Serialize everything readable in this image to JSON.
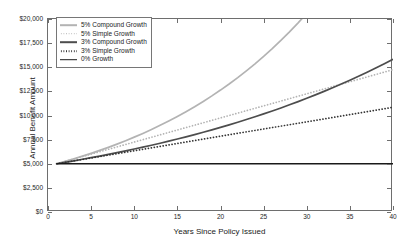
{
  "chart_data": {
    "type": "line",
    "title": "",
    "xlabel": "Years Since Policy Issued",
    "ylabel": "Annual Benefit Amount",
    "xlim": [
      0,
      40
    ],
    "ylim": [
      0,
      20000
    ],
    "xticks": [
      0,
      5,
      10,
      15,
      20,
      25,
      30,
      35,
      40
    ],
    "xtick_labels": [
      "0",
      "5",
      "10",
      "15",
      "20",
      "25",
      "30",
      "35",
      "40"
    ],
    "yticks": [
      0,
      2500,
      5000,
      7500,
      10000,
      12500,
      15000,
      17500,
      20000
    ],
    "ytick_labels": [
      "$0",
      "$2,500",
      "$5,000",
      "$7,500",
      "$10,000",
      "$12,500",
      "$15,000",
      "$17,500",
      "$20,000"
    ],
    "grid": false,
    "legend_position": "upper left",
    "base_amount": 5000,
    "start_year": 1,
    "x": [
      1,
      2,
      3,
      4,
      5,
      6,
      7,
      8,
      9,
      10,
      11,
      12,
      13,
      14,
      15,
      16,
      17,
      18,
      19,
      20,
      21,
      22,
      23,
      24,
      25,
      26,
      27,
      28,
      29,
      30,
      31,
      32,
      33,
      34,
      35,
      36,
      37,
      38,
      39,
      40
    ],
    "series": [
      {
        "name": "5% Compound Growth",
        "style": "solid",
        "color": "#b3b3b3",
        "rate": 0.05,
        "growth": "compound",
        "clipped_at_year": 29.2,
        "values": [
          5000,
          5250,
          5513,
          5788,
          6078,
          6381,
          6700,
          7036,
          7387,
          7757,
          8144,
          8552,
          8979,
          9428,
          9900,
          10395,
          10914,
          11460,
          12033,
          12635,
          13267,
          13930,
          14627,
          15358,
          16126,
          16932,
          17779,
          18668,
          19601,
          20581,
          21610,
          22691,
          23825,
          25017,
          26268,
          27581,
          28960,
          30408,
          31929,
          33525
        ]
      },
      {
        "name": "5% Simple Growth",
        "style": "dotted",
        "color": "#b3b3b3",
        "rate": 0.05,
        "growth": "simple",
        "values": [
          5000,
          5250,
          5500,
          5750,
          6000,
          6250,
          6500,
          6750,
          7000,
          7250,
          7500,
          7750,
          8000,
          8250,
          8500,
          8750,
          9000,
          9250,
          9500,
          9750,
          10000,
          10250,
          10500,
          10750,
          11000,
          11250,
          11500,
          11750,
          12000,
          12250,
          12500,
          12750,
          13000,
          13250,
          13500,
          13750,
          14000,
          14250,
          14500,
          14750
        ]
      },
      {
        "name": "3% Compound Growth",
        "style": "solid",
        "color": "#4d4d4d",
        "rate": 0.03,
        "growth": "compound",
        "values": [
          5000,
          5150,
          5305,
          5464,
          5628,
          5796,
          5970,
          6149,
          6334,
          6524,
          6720,
          6921,
          7129,
          7343,
          7563,
          7790,
          8024,
          8264,
          8512,
          8768,
          9031,
          9302,
          9581,
          9868,
          10164,
          10469,
          10783,
          11107,
          11440,
          11783,
          12137,
          12501,
          12876,
          13262,
          13660,
          14070,
          14492,
          14926,
          15374,
          15836
        ]
      },
      {
        "name": "3% Simple Growth",
        "style": "dotted",
        "color": "#333333",
        "rate": 0.03,
        "growth": "simple",
        "values": [
          5000,
          5150,
          5300,
          5450,
          5600,
          5750,
          5900,
          6050,
          6200,
          6350,
          6500,
          6650,
          6800,
          6950,
          7100,
          7250,
          7400,
          7550,
          7700,
          7850,
          8000,
          8150,
          8300,
          8450,
          8600,
          8750,
          8900,
          9050,
          9200,
          9350,
          9500,
          9650,
          9800,
          9950,
          10100,
          10250,
          10400,
          10550,
          10700,
          10850
        ]
      },
      {
        "name": "0% Growth",
        "style": "solid",
        "color": "#1a1a1a",
        "rate": 0.0,
        "growth": "none",
        "values": [
          5000,
          5000,
          5000,
          5000,
          5000,
          5000,
          5000,
          5000,
          5000,
          5000,
          5000,
          5000,
          5000,
          5000,
          5000,
          5000,
          5000,
          5000,
          5000,
          5000,
          5000,
          5000,
          5000,
          5000,
          5000,
          5000,
          5000,
          5000,
          5000,
          5000,
          5000,
          5000,
          5000,
          5000,
          5000,
          5000,
          5000,
          5000,
          5000,
          5000
        ]
      }
    ]
  },
  "axis_color": "#6e6e6e",
  "text_color": "#1a1a1a"
}
